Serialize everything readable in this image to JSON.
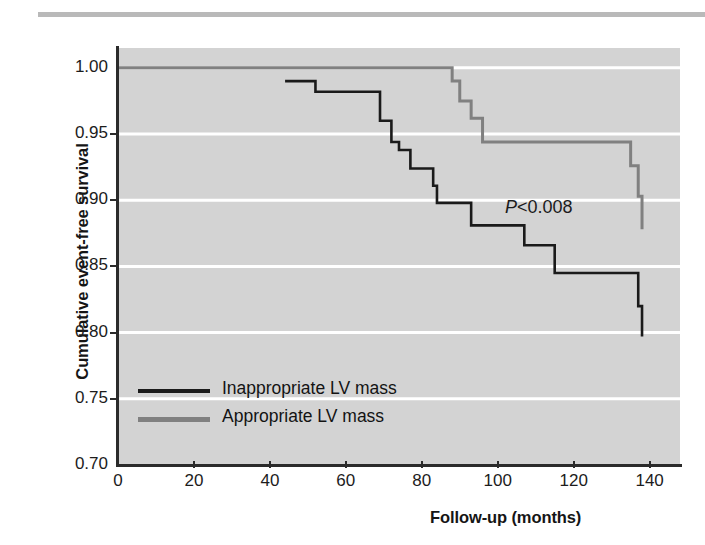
{
  "figure": {
    "top_rule": "decorative-rule",
    "plot_background_color": "#d3d3d3",
    "gridline_color": "#ffffff",
    "axis_color": "#2b2b2b"
  },
  "annotation": {
    "p_symbol": "P",
    "p_text": "<0.008",
    "p_full": "P<0.008"
  },
  "legend": {
    "position": "inside-lower-left",
    "entries": [
      {
        "label": "Inappropriate LV mass",
        "color": "#1a1a1a"
      },
      {
        "label": "Appropriate LV mass",
        "color": "#808080"
      }
    ]
  },
  "chart_data": {
    "type": "line",
    "subtype": "kaplan-meier-step",
    "title": "",
    "subtitle": "",
    "xlabel": "Follow-up (months)",
    "ylabel": "Cumulative event-free survival",
    "xlim": [
      0,
      148
    ],
    "ylim": [
      0.7,
      1.015
    ],
    "xticks": [
      0,
      20,
      40,
      60,
      80,
      100,
      120,
      140
    ],
    "xtick_labels": [
      "0",
      "20",
      "40",
      "60",
      "80",
      "100",
      "120",
      "140"
    ],
    "yticks": [
      0.7,
      0.75,
      0.8,
      0.85,
      0.9,
      0.95,
      1.0
    ],
    "ytick_labels": [
      "0.70",
      "0.75",
      "0.80",
      "0.85",
      "0.90",
      "0.95",
      "1.00"
    ],
    "grid": "horizontal-only",
    "grid_color": "#ffffff",
    "legend_position": "lower-left-inside",
    "annotations": [
      {
        "text": "P<0.008",
        "x": 108,
        "y": 0.905,
        "italic_prefix": "P"
      }
    ],
    "series": [
      {
        "name": "Inappropriate LV mass",
        "color": "#1a1a1a",
        "linewidth": 2.6,
        "step": "post",
        "x": [
          44,
          48,
          52,
          60,
          69,
          72,
          74,
          77,
          83,
          84,
          93,
          107,
          115,
          135,
          137,
          138
        ],
        "y": [
          0.99,
          0.99,
          0.982,
          0.982,
          0.96,
          0.944,
          0.938,
          0.924,
          0.911,
          0.898,
          0.881,
          0.866,
          0.845,
          0.845,
          0.82,
          0.797
        ]
      },
      {
        "name": "Appropriate LV mass",
        "color": "#808080",
        "linewidth": 3.0,
        "step": "post",
        "x": [
          0,
          48,
          88,
          90,
          93,
          96,
          122,
          135,
          137,
          138
        ],
        "y": [
          1.0,
          1.0,
          0.99,
          0.975,
          0.962,
          0.944,
          0.944,
          0.926,
          0.903,
          0.878
        ]
      }
    ]
  }
}
